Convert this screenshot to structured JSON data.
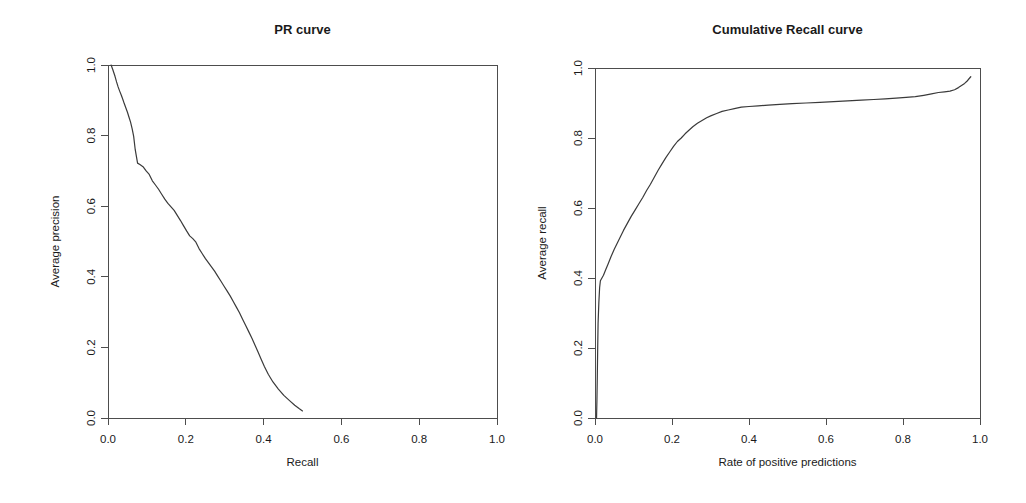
{
  "figure": {
    "background_color": "#ffffff",
    "line_color": "#3a3a3a",
    "axis_color": "#4d4d4d",
    "width": 1026,
    "height": 503
  },
  "panels": {
    "left": {
      "title": "PR curve",
      "xlabel": "Recall",
      "ylabel": "Average precision",
      "xticks": [
        "0.0",
        "0.2",
        "0.4",
        "0.6",
        "0.8",
        "1.0"
      ],
      "yticks": [
        "0.0",
        "0.2",
        "0.4",
        "0.6",
        "0.8",
        "1.0"
      ]
    },
    "right": {
      "title": "Cumulative Recall curve",
      "xlabel": "Rate of positive predictions",
      "ylabel": "Average recall",
      "xticks": [
        "0.0",
        "0.2",
        "0.4",
        "0.6",
        "0.8",
        "1.0"
      ],
      "yticks": [
        "0.0",
        "0.2",
        "0.4",
        "0.6",
        "0.8",
        "1.0"
      ]
    }
  },
  "chart_data": [
    {
      "type": "line",
      "title": "PR curve",
      "xlabel": "Recall",
      "ylabel": "Average precision",
      "xlim": [
        0.0,
        1.0
      ],
      "ylim": [
        0.0,
        1.0
      ],
      "xticks": [
        0.0,
        0.2,
        0.4,
        0.6,
        0.8,
        1.0
      ],
      "yticks": [
        0.0,
        0.2,
        0.4,
        0.6,
        0.8,
        1.0
      ],
      "grid": false,
      "legend": "none",
      "series": [
        {
          "name": "Precision vs Recall",
          "x": [
            0.008,
            0.012,
            0.018,
            0.022,
            0.026,
            0.03,
            0.034,
            0.038,
            0.042,
            0.046,
            0.05,
            0.054,
            0.058,
            0.062,
            0.066,
            0.07,
            0.076,
            0.082,
            0.09,
            0.098,
            0.106,
            0.114,
            0.122,
            0.13,
            0.138,
            0.146,
            0.154,
            0.162,
            0.17,
            0.178,
            0.186,
            0.194,
            0.202,
            0.21,
            0.218,
            0.226,
            0.234,
            0.242,
            0.25,
            0.258,
            0.266,
            0.274,
            0.282,
            0.29,
            0.298,
            0.306,
            0.314,
            0.322,
            0.33,
            0.338,
            0.346,
            0.354,
            0.362,
            0.37,
            0.378,
            0.386,
            0.394,
            0.402,
            0.412,
            0.424,
            0.438,
            0.452,
            0.466,
            0.48,
            0.492,
            0.5
          ],
          "y": [
            1.0,
            0.988,
            0.968,
            0.952,
            0.938,
            0.926,
            0.915,
            0.903,
            0.89,
            0.878,
            0.866,
            0.852,
            0.838,
            0.82,
            0.798,
            0.76,
            0.722,
            0.718,
            0.712,
            0.7,
            0.69,
            0.672,
            0.66,
            0.648,
            0.634,
            0.62,
            0.608,
            0.598,
            0.588,
            0.574,
            0.56,
            0.545,
            0.53,
            0.516,
            0.508,
            0.498,
            0.48,
            0.466,
            0.452,
            0.44,
            0.428,
            0.416,
            0.402,
            0.388,
            0.374,
            0.36,
            0.346,
            0.33,
            0.314,
            0.298,
            0.28,
            0.262,
            0.244,
            0.226,
            0.206,
            0.186,
            0.166,
            0.146,
            0.124,
            0.102,
            0.082,
            0.064,
            0.05,
            0.036,
            0.026,
            0.02
          ]
        }
      ]
    },
    {
      "type": "line",
      "title": "Cumulative Recall curve",
      "xlabel": "Rate of positive predictions",
      "ylabel": "Average recall",
      "xlim": [
        0.0,
        1.0
      ],
      "ylim": [
        0.0,
        1.0
      ],
      "xticks": [
        0.0,
        0.2,
        0.4,
        0.6,
        0.8,
        1.0
      ],
      "yticks": [
        0.0,
        0.2,
        0.4,
        0.6,
        0.8,
        1.0
      ],
      "grid": false,
      "legend": "none",
      "series": [
        {
          "name": "Recall vs Rate of positive predictions",
          "x": [
            0.004,
            0.005,
            0.006,
            0.007,
            0.008,
            0.01,
            0.012,
            0.014,
            0.018,
            0.022,
            0.028,
            0.034,
            0.042,
            0.05,
            0.058,
            0.066,
            0.074,
            0.084,
            0.094,
            0.104,
            0.114,
            0.124,
            0.134,
            0.144,
            0.154,
            0.164,
            0.174,
            0.184,
            0.194,
            0.204,
            0.214,
            0.224,
            0.234,
            0.244,
            0.254,
            0.266,
            0.278,
            0.29,
            0.302,
            0.316,
            0.33,
            0.346,
            0.362,
            0.38,
            0.4,
            0.424,
            0.45,
            0.48,
            0.512,
            0.548,
            0.584,
            0.62,
            0.656,
            0.692,
            0.724,
            0.754,
            0.782,
            0.808,
            0.832,
            0.854,
            0.874,
            0.892,
            0.908,
            0.922,
            0.934,
            0.944,
            0.952,
            0.96,
            0.966,
            0.972,
            0.976
          ],
          "y": [
            0.0,
            0.05,
            0.12,
            0.2,
            0.27,
            0.33,
            0.372,
            0.392,
            0.4,
            0.408,
            0.424,
            0.44,
            0.462,
            0.482,
            0.5,
            0.518,
            0.536,
            0.556,
            0.576,
            0.594,
            0.612,
            0.63,
            0.65,
            0.668,
            0.688,
            0.708,
            0.726,
            0.744,
            0.76,
            0.776,
            0.79,
            0.8,
            0.812,
            0.822,
            0.832,
            0.842,
            0.85,
            0.858,
            0.864,
            0.87,
            0.876,
            0.88,
            0.884,
            0.888,
            0.89,
            0.892,
            0.894,
            0.896,
            0.898,
            0.9,
            0.902,
            0.904,
            0.906,
            0.908,
            0.91,
            0.912,
            0.914,
            0.916,
            0.918,
            0.922,
            0.926,
            0.93,
            0.932,
            0.934,
            0.938,
            0.944,
            0.95,
            0.956,
            0.962,
            0.97,
            0.975
          ]
        }
      ]
    }
  ]
}
